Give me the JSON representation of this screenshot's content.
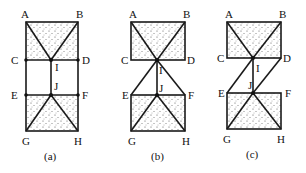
{
  "figure": {
    "panels": [
      {
        "id": "a",
        "caption": "(a)",
        "labels": {
          "A": "A",
          "B": "B",
          "C": "C",
          "D": "D",
          "E": "E",
          "F": "F",
          "G": "G",
          "H": "H",
          "I": "I",
          "J": "J"
        }
      },
      {
        "id": "b",
        "caption": "(b)",
        "labels": {
          "A": "A",
          "B": "B",
          "C": "C",
          "D": "D",
          "E": "E",
          "F": "F",
          "G": "G",
          "H": "H",
          "I": "I",
          "J": "J"
        }
      },
      {
        "id": "c",
        "caption": "(c)",
        "labels": {
          "A": "A",
          "B": "B",
          "C": "C",
          "D": "D",
          "E": "E",
          "F": "F",
          "G": "G",
          "H": "H",
          "I": "I",
          "J": "J"
        }
      }
    ],
    "colors": {
      "line": "#1a1a1a",
      "stipple": "#555555",
      "background": "#ffffff"
    }
  }
}
